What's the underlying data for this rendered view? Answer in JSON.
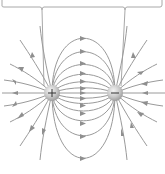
{
  "diagram": {
    "title": "Electric field lines of a dipole",
    "charges": [
      {
        "id": "positive",
        "sign": "+",
        "label": "positive-charge",
        "x": 52,
        "y": 93
      },
      {
        "id": "negative",
        "sign": "-",
        "label": "negative-charge",
        "x": 115,
        "y": 93
      }
    ],
    "colors": {
      "field_line": "#9a9a9a",
      "arrow": "#8f8f8f",
      "charge_fill": "#c8c8c8",
      "charge_highlight": "#f0f0f0",
      "bracket": "#a8a8a8",
      "background": "#ffffff"
    },
    "field_direction": "from positive to negative",
    "arc_count_above": 5,
    "arc_count_below": 5,
    "bracket": {
      "left_stem_x": 42,
      "right_stem_x": 125,
      "bar_y": 6
    }
  }
}
